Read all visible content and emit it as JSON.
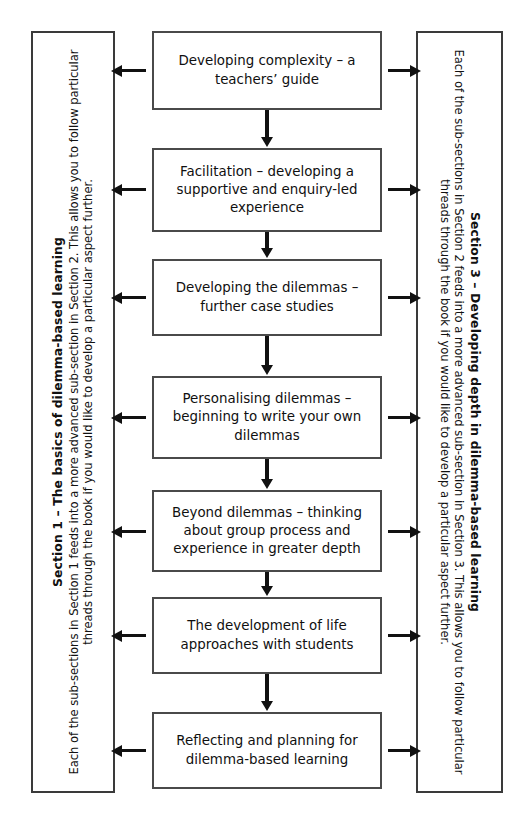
{
  "diagram": {
    "type": "flowchart",
    "orientation": "vertical-with-side-panels"
  },
  "left_panel": {
    "name": "section-1-panel",
    "title": "Section 1 – The basics of dilemma-based learning",
    "body": "Each of the sub-sections in Section 1 feeds into a more advanced sub-section in Section 2. This allows you to follow particular threads through the book if you would like to develop a particular aspect further.",
    "rotation": "-90"
  },
  "right_panel": {
    "name": "section-3-panel",
    "title": "Section 3 – Developing depth in dilemma-based learning",
    "body": "Each of the sub-sections in Section 2 feeds into a more advanced sub-section in Section 3. This allows you to follow particular threads through the book if you would like to develop a particular aspect further.",
    "rotation": "90"
  },
  "boxes": [
    {
      "id": 1,
      "label": "Developing complexity – a teachers’ guide"
    },
    {
      "id": 2,
      "label": "Facilitation – developing a supportive and enquiry-led experience"
    },
    {
      "id": 3,
      "label": "Developing the dilemmas – further case studies"
    },
    {
      "id": 4,
      "label": "Personalising dilemmas – beginning to write your own dilemmas"
    },
    {
      "id": 5,
      "label": "Beyond dilemmas – thinking about group process and experience in greater depth"
    },
    {
      "id": 6,
      "label": "The development of life approaches with students"
    },
    {
      "id": 7,
      "label": "Reflecting and planning for dilemma-based learning"
    }
  ],
  "connectors": {
    "down_arrow_count": 6,
    "left_arrow_count": 7,
    "right_arrow_count": 7,
    "arrow_color": "#111111"
  },
  "colors": {
    "background": "#ffffff",
    "box_border": "#4a4a4a",
    "panel_border": "#3a3a3a",
    "text": "#101010"
  }
}
